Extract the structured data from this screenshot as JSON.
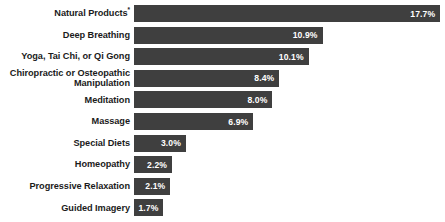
{
  "chart_data": {
    "type": "bar",
    "orientation": "horizontal",
    "title": "",
    "subtitle": "",
    "xlabel": "",
    "ylabel": "",
    "grid": false,
    "legend": null,
    "axis_visible": false,
    "xlim": [
      0,
      18
    ],
    "value_suffix": "%",
    "categories": [
      "Natural Products*",
      "Deep Breathing",
      "Yoga, Tai Chi, or Qi Gong",
      "Chiropractic or Osteopathic\nManipulation",
      "Meditation",
      "Massage",
      "Special Diets",
      "Homeopathy",
      "Progressive Relaxation",
      "Guided Imagery"
    ],
    "values": [
      17.7,
      10.9,
      10.1,
      8.4,
      8.0,
      6.9,
      3.0,
      2.2,
      2.1,
      1.7
    ],
    "value_labels": [
      "17.7%",
      "10.9%",
      "10.1%",
      "8.4%",
      "8.0%",
      "6.9%",
      "3.0%",
      "2.2%",
      "2.1%",
      "1.7%"
    ],
    "rows": [
      {
        "label": "Natural Products",
        "footnote_marker": "*",
        "value": 17.7,
        "value_label": "17.7%",
        "two_line": false
      },
      {
        "label": "Deep Breathing",
        "footnote_marker": "",
        "value": 10.9,
        "value_label": "10.9%",
        "two_line": false
      },
      {
        "label": "Yoga, Tai Chi, or Qi Gong",
        "footnote_marker": "",
        "value": 10.1,
        "value_label": "10.1%",
        "two_line": false
      },
      {
        "label": "Chiropractic or Osteopathic\nManipulation",
        "footnote_marker": "",
        "value": 8.4,
        "value_label": "8.4%",
        "two_line": true
      },
      {
        "label": "Meditation",
        "footnote_marker": "",
        "value": 8.0,
        "value_label": "8.0%",
        "two_line": false
      },
      {
        "label": "Massage",
        "footnote_marker": "",
        "value": 6.9,
        "value_label": "6.9%",
        "two_line": false
      },
      {
        "label": "Special Diets",
        "footnote_marker": "",
        "value": 3.0,
        "value_label": "3.0%",
        "two_line": false
      },
      {
        "label": "Homeopathy",
        "footnote_marker": "",
        "value": 2.2,
        "value_label": "2.2%",
        "two_line": false
      },
      {
        "label": "Progressive Relaxation",
        "footnote_marker": "",
        "value": 2.1,
        "value_label": "2.1%",
        "two_line": false
      },
      {
        "label": "Guided Imagery",
        "footnote_marker": "",
        "value": 1.7,
        "value_label": "1.7%",
        "two_line": false
      }
    ]
  },
  "style": {
    "bar_color": "#3f3f3f",
    "value_text_color": "#ffffff",
    "label_text_color": "#1b1b1b",
    "background_color": "#ffffff"
  },
  "layout": {
    "bar_origin_x_px": 134,
    "px_per_percent": 17.3,
    "bar_height_px": 17,
    "row_pitch_px": 21.6,
    "first_bar_top_px": 5
  }
}
